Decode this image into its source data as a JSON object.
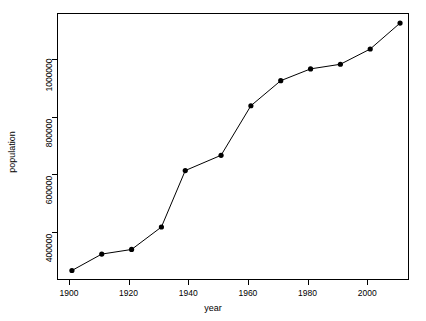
{
  "chart_data": {
    "type": "line",
    "title": "",
    "xlabel": "year",
    "ylabel": "population",
    "x": [
      1901,
      1911,
      1921,
      1931,
      1939,
      1951,
      1961,
      1971,
      1981,
      1991,
      2001,
      2011
    ],
    "values": [
      266000,
      323000,
      339000,
      417000,
      613000,
      666000,
      838000,
      925000,
      966000,
      982000,
      1035000,
      1125000
    ],
    "series": [
      {
        "name": "population",
        "values": [
          266000,
          323000,
          339000,
          417000,
          613000,
          666000,
          838000,
          925000,
          966000,
          982000,
          1035000,
          1125000
        ]
      }
    ],
    "xlim": [
      1896,
      2014
    ],
    "ylim": [
      233000,
      1160000
    ],
    "xticks": [
      1900,
      1920,
      1940,
      1960,
      1980,
      2000
    ],
    "xtick_labels": [
      "1900",
      "1920",
      "1940",
      "1960",
      "1980",
      "2000"
    ],
    "yticks": [
      400000,
      600000,
      800000,
      1000000
    ],
    "ytick_labels": [
      "400000",
      "600000",
      "800000",
      "1000000"
    ],
    "grid": false,
    "legend": false,
    "marker": "filled-circle",
    "line_color": "#000000",
    "marker_color": "#000000",
    "background": "#ffffff",
    "frame": true
  }
}
